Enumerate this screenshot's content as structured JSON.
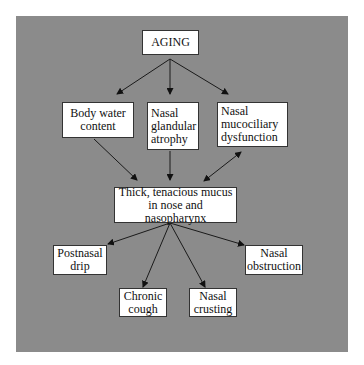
{
  "diagram": {
    "type": "flowchart",
    "background_color": "#8b8b8b",
    "node_fill": "#ffffff",
    "nodes": {
      "aging": {
        "label": "AGING"
      },
      "body_water": {
        "label": "Body water\ncontent"
      },
      "glandular": {
        "label": "Nasal\nglandular\natrophy"
      },
      "mucociliary": {
        "label": "Nasal\nmucociliary\ndysfunction"
      },
      "mucus": {
        "label": "Thick, tenacious mucus\nin nose and nasopharynx"
      },
      "postnasal": {
        "label": "Postnasal\ndrip"
      },
      "cough": {
        "label": "Chronic\ncough"
      },
      "crusting": {
        "label": "Nasal\ncrusting"
      },
      "obstruction": {
        "label": "Nasal\nobstruction"
      }
    },
    "edges": [
      {
        "from": "aging",
        "to": "body_water",
        "direction": "forward"
      },
      {
        "from": "aging",
        "to": "glandular",
        "direction": "forward"
      },
      {
        "from": "aging",
        "to": "mucociliary",
        "direction": "forward"
      },
      {
        "from": "body_water",
        "to": "mucus",
        "direction": "forward"
      },
      {
        "from": "glandular",
        "to": "mucus",
        "direction": "forward"
      },
      {
        "from": "mucociliary",
        "to": "mucus",
        "direction": "bidirectional"
      },
      {
        "from": "mucus",
        "to": "postnasal",
        "direction": "forward"
      },
      {
        "from": "mucus",
        "to": "cough",
        "direction": "forward"
      },
      {
        "from": "mucus",
        "to": "crusting",
        "direction": "forward"
      },
      {
        "from": "mucus",
        "to": "obstruction",
        "direction": "forward"
      }
    ]
  }
}
